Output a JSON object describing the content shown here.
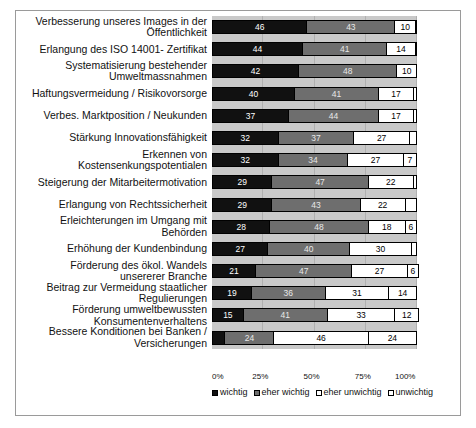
{
  "chart_data": {
    "type": "bar",
    "subtype": "stacked-horizontal-100percent",
    "title": "",
    "xlabel": "",
    "ylabel": "",
    "xlim": [
      0,
      100
    ],
    "grid": true,
    "legend_position": "bottom",
    "tick_labels": [
      "0%",
      "25%",
      "50%",
      "75%",
      "100%"
    ],
    "tick_values": [
      0,
      25,
      50,
      75,
      100
    ],
    "series": [
      {
        "name": "wichtig",
        "color": "#111111",
        "values": [
          46,
          44,
          42,
          40,
          37,
          32,
          32,
          29,
          29,
          28,
          27,
          21,
          19,
          15,
          6
        ]
      },
      {
        "name": "eher wichtig",
        "color": "#6e6e6e",
        "values": [
          43,
          41,
          48,
          41,
          44,
          37,
          34,
          47,
          43,
          48,
          40,
          47,
          36,
          41,
          24
        ]
      },
      {
        "name": "eher unwichtig",
        "color": "#ffffff",
        "values": [
          10,
          14,
          10,
          17,
          17,
          27,
          27,
          22,
          22,
          18,
          30,
          27,
          31,
          33,
          46
        ]
      },
      {
        "name": "unwichtig",
        "color": "#ffffff",
        "values": [
          1,
          1,
          0,
          2,
          2,
          4,
          7,
          2,
          6,
          6,
          3,
          6,
          14,
          12,
          24
        ]
      }
    ],
    "labels_shown": [
      [
        "46",
        "43",
        "10",
        ""
      ],
      [
        "44",
        "41",
        "14",
        ""
      ],
      [
        "42",
        "48",
        "10",
        ""
      ],
      [
        "40",
        "41",
        "17",
        ""
      ],
      [
        "37",
        "44",
        "17",
        ""
      ],
      [
        "32",
        "37",
        "27",
        ""
      ],
      [
        "32",
        "34",
        "27",
        "7"
      ],
      [
        "29",
        "47",
        "22",
        ""
      ],
      [
        "29",
        "43",
        "22",
        ""
      ],
      [
        "28",
        "48",
        "18",
        "6"
      ],
      [
        "27",
        "40",
        "30",
        ""
      ],
      [
        "21",
        "47",
        "27",
        "6"
      ],
      [
        "19",
        "36",
        "31",
        "14"
      ],
      [
        "15",
        "41",
        "33",
        "12"
      ],
      [
        "",
        "24",
        "46",
        "24"
      ]
    ],
    "categories": [
      "Verbesserung unseres Images in der\nÖffentlichkeit",
      "Erlangung des ISO 14001- Zertifikat",
      "Systematisierung bestehender\nUmweltmassnahmen",
      "Haftungsvermeidung / Risikovorsorge",
      "Verbes. Marktposition / Neukunden",
      "Stärkung Innovationsfähigkeit",
      "Erkennen von\nKostensenkungspotentialen",
      "Steigerung der Mitarbeitermotivation",
      "Erlangung von Rechtssicherheit",
      "Erleichterungen im Umgang mit\nBehörden",
      "Erhöhung der Kundenbindung",
      "Förderung des ökol. Wandels\nunsererer Branche",
      "Beitrag zur Vermeidung staatlicher\nRegulierungen",
      "Förderung umweltbewussten\nKonsumentenverhaltens",
      "Bessere Konditionen bei Banken /\nVersicherungen"
    ]
  }
}
